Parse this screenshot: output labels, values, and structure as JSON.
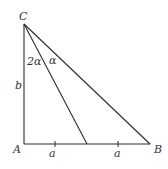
{
  "diagram": {
    "type": "geometry-triangle",
    "vertices": {
      "A": "A",
      "B": "B",
      "C": "C"
    },
    "angle_labels": {
      "angle_ACD": "2α",
      "angle_DCB": "α"
    },
    "side_labels": {
      "AC": "b",
      "AD": "a",
      "DB": "a"
    },
    "right_angle_at": "A",
    "colors": {
      "stroke": "#2b2b2b",
      "text": "#333333",
      "background": "#ffffff"
    }
  }
}
